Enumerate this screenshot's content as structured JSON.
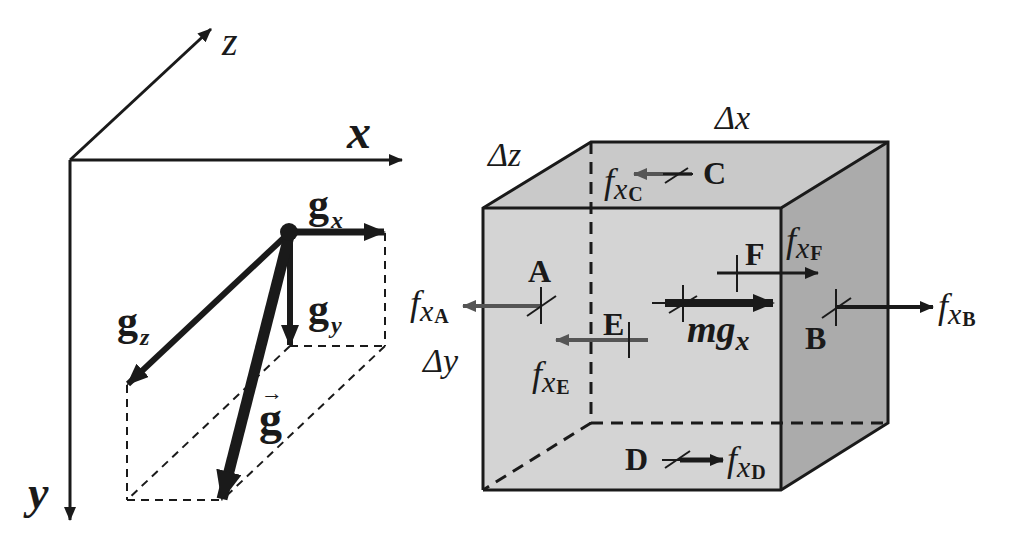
{
  "figure": {
    "colors": {
      "line": "#1a1a1a",
      "front_face": "#d4d4d4",
      "top_face": "#c9c9c9",
      "side_face": "#ababab",
      "surface_force_arrow": "#555555",
      "background": "#ffffff"
    },
    "axes": {
      "x_label": "x",
      "y_label": "y",
      "z_label": "z"
    },
    "gravity_components": {
      "gx_base": "g",
      "gx_sub": "x",
      "gy_base": "g",
      "gy_sub": "y",
      "gz_base": "g",
      "gz_sub": "z",
      "g_vector": "g",
      "g_vector_arrow": "→"
    },
    "cube": {
      "dimensions": {
        "dx": "Δx",
        "dy": "Δy",
        "dz": "Δz"
      },
      "points": [
        "A",
        "B",
        "C",
        "D",
        "E",
        "F"
      ],
      "point_labels": {
        "A": "A",
        "B": "B",
        "C": "C",
        "D": "D",
        "E": "E",
        "F": "F"
      },
      "forces": {
        "fxA": {
          "base": "f",
          "sub1": "x",
          "sub2": "A",
          "direction": "left"
        },
        "fxB": {
          "base": "f",
          "sub1": "x",
          "sub2": "B",
          "direction": "right"
        },
        "fxC": {
          "base": "f",
          "sub1": "x",
          "sub2": "C",
          "direction": "left"
        },
        "fxD": {
          "base": "f",
          "sub1": "x",
          "sub2": "D",
          "direction": "right"
        },
        "fxE": {
          "base": "f",
          "sub1": "x",
          "sub2": "E",
          "direction": "left"
        },
        "fxF": {
          "base": "f",
          "sub1": "x",
          "sub2": "F",
          "direction": "right"
        }
      },
      "body_force": {
        "base": "mg",
        "sub": "x",
        "direction": "right"
      }
    }
  }
}
